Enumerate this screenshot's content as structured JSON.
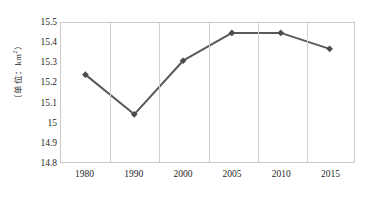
{
  "chart_data": {
    "type": "line",
    "title": "",
    "subtitle": "",
    "xlabel": "",
    "ylabel": "（单位：km²）",
    "categories": [
      "1980",
      "1990",
      "2000",
      "2005",
      "2010",
      "2015"
    ],
    "values": [
      15.24,
      15.04,
      15.31,
      15.45,
      15.45,
      15.37
    ],
    "series": [
      {
        "name": "",
        "values": [
          15.24,
          15.04,
          15.31,
          15.45,
          15.45,
          15.37
        ]
      }
    ],
    "ylim": [
      14.8,
      15.5
    ],
    "ytick_labels": [
      "15.5",
      "15.4",
      "15.3",
      "15.2",
      "15.1",
      "15",
      "14.9",
      "14.8"
    ],
    "ytick_values": [
      15.5,
      15.4,
      15.3,
      15.2,
      15.1,
      15.0,
      14.9,
      14.8
    ],
    "ystep": 0.1,
    "grid": "vertical-only",
    "legend": "none",
    "marker": "diamond",
    "line_color": "#595959",
    "marker_color": "#4d4d4d",
    "gridline_color": "#cfcfcf",
    "plot_border_color": "#c9c9c9",
    "annotations": []
  },
  "axis_titles": {
    "y_unit_text": "（单位：km²）",
    "y_unit_prefix": "（单位：km",
    "y_unit_sup": "2",
    "y_unit_suffix": "）"
  }
}
